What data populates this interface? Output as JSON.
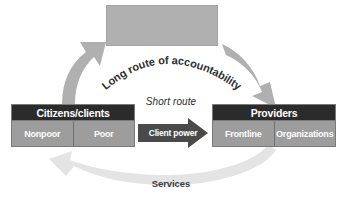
{
  "diagram": {
    "colors": {
      "arrow_gray": "#b0b0b0",
      "arrow_light": "#e2e2e2",
      "arrow_dark": "#4a4a4a",
      "box_header": "#2b2b2b",
      "box_body": "#9d9d9d",
      "top_box": "#b0b0b0",
      "text_dark": "#2f2f2f",
      "text_light": "#ffffff",
      "background": "#ffffff"
    },
    "top_box": {
      "label": "",
      "fill": "#b0b0b0"
    },
    "actors": [
      {
        "id": "citizens",
        "header": "Citizens/clients",
        "cells": [
          "Nonpoor",
          "Poor"
        ]
      },
      {
        "id": "providers",
        "header": "Providers",
        "cells": [
          "Frontline",
          "Organizations"
        ]
      }
    ],
    "routes": [
      {
        "id": "long-route",
        "label": "Long route of accountability",
        "style": "curved-arc-text",
        "from": "citizens",
        "to": "providers",
        "via": "top-box"
      },
      {
        "id": "short-route",
        "label": "Short route",
        "style": "italic-caption",
        "from": "citizens",
        "to": "providers"
      },
      {
        "id": "client-power",
        "label": "Client power",
        "style": "solid-dark-arrow",
        "direction": "right",
        "from": "citizens",
        "to": "providers"
      },
      {
        "id": "services",
        "label": "Services",
        "style": "light-arc-arrow",
        "direction": "left",
        "from": "providers",
        "to": "citizens"
      }
    ],
    "arrows": [
      {
        "id": "voice-arrow",
        "direction": "up",
        "from": "citizens",
        "to": "top-box"
      },
      {
        "id": "compact-arrow",
        "direction": "down",
        "from": "top-box",
        "to": "providers"
      }
    ]
  }
}
